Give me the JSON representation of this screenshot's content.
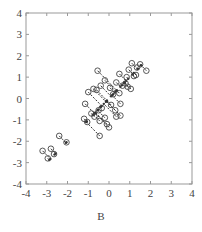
{
  "chart_data": {
    "type": "scatter",
    "title": "",
    "caption": "B",
    "xlabel": "",
    "ylabel": "",
    "xlim": [
      -4,
      4
    ],
    "ylim": [
      -4,
      4
    ],
    "xticks": [
      -4,
      -3,
      -2,
      -1,
      0,
      1,
      2,
      3,
      4
    ],
    "yticks": [
      -4,
      -3,
      -2,
      -1,
      0,
      1,
      2,
      3,
      4
    ],
    "grid": false,
    "legend": null,
    "series": [
      {
        "name": "points",
        "marker": "open-circle",
        "points": [
          [
            -3.2,
            -2.45
          ],
          [
            -2.8,
            -2.35
          ],
          [
            -2.65,
            -2.6
          ],
          [
            -2.95,
            -2.8
          ],
          [
            -2.4,
            -1.75
          ],
          [
            -2.05,
            -2.05
          ],
          [
            -1.2,
            -0.95
          ],
          [
            -1.05,
            -1.1
          ],
          [
            -1.15,
            -0.25
          ],
          [
            -1.0,
            0.3
          ],
          [
            -0.85,
            -0.7
          ],
          [
            -0.7,
            -0.85
          ],
          [
            -0.75,
            0.45
          ],
          [
            -0.55,
            1.3
          ],
          [
            -0.6,
            0.4
          ],
          [
            -0.5,
            -0.55
          ],
          [
            -0.45,
            -1.05
          ],
          [
            -0.4,
            0.6
          ],
          [
            -0.35,
            -0.45
          ],
          [
            -0.45,
            -1.75
          ],
          [
            -0.2,
            -0.9
          ],
          [
            -0.2,
            0.85
          ],
          [
            -0.1,
            -1.2
          ],
          [
            0.0,
            -1.35
          ],
          [
            0.05,
            0.5
          ],
          [
            0.1,
            -0.3
          ],
          [
            0.2,
            0.2
          ],
          [
            0.3,
            -0.55
          ],
          [
            0.35,
            0.75
          ],
          [
            0.35,
            -0.85
          ],
          [
            0.5,
            0.25
          ],
          [
            0.55,
            -0.8
          ],
          [
            0.5,
            1.15
          ],
          [
            0.55,
            -0.25
          ],
          [
            0.65,
            0.6
          ],
          [
            0.8,
            0.7
          ],
          [
            0.85,
            1.0
          ],
          [
            0.9,
            0.55
          ],
          [
            0.95,
            1.35
          ],
          [
            1.05,
            0.45
          ],
          [
            1.1,
            1.65
          ],
          [
            1.2,
            1.05
          ],
          [
            1.3,
            1.1
          ],
          [
            1.35,
            1.45
          ],
          [
            1.5,
            1.6
          ],
          [
            1.8,
            1.3
          ]
        ]
      }
    ],
    "projection_line": {
      "slope": 1.0,
      "intercept": 0.0
    }
  },
  "caption_label": "B",
  "axes": {
    "x_tick_labels": [
      "-4",
      "-3",
      "-2",
      "-1",
      "0",
      "1",
      "2",
      "3",
      "4"
    ],
    "y_tick_labels": [
      "4",
      "3",
      "2",
      "1",
      "0",
      "-1",
      "-2",
      "-3",
      "-4"
    ]
  }
}
